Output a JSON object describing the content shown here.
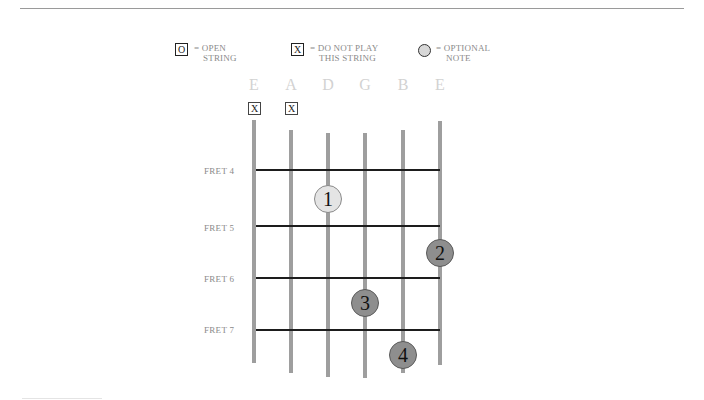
{
  "legend": {
    "open": {
      "symbol": "O",
      "line1": "= OPEN",
      "line2": "STRING"
    },
    "mute": {
      "symbol": "X",
      "line1": "= DO NOT PLAY",
      "line2": "THIS STRING"
    },
    "optional": {
      "line1": "= OPTIONAL",
      "line2": "NOTE"
    }
  },
  "strings": [
    "E",
    "A",
    "D",
    "G",
    "B",
    "E"
  ],
  "muted_strings": [
    {
      "string": "E",
      "symbol": "X"
    },
    {
      "string": "A",
      "symbol": "X"
    }
  ],
  "frets": [
    {
      "label": "FRET 4"
    },
    {
      "label": "FRET 5"
    },
    {
      "label": "FRET 6"
    },
    {
      "label": "FRET 7"
    }
  ],
  "notes": [
    {
      "finger": "1",
      "string": "D",
      "fret": 4,
      "type": "optional"
    },
    {
      "finger": "2",
      "string": "E",
      "fret": 5,
      "type": "played"
    },
    {
      "finger": "3",
      "string": "G",
      "fret": 6,
      "type": "played"
    },
    {
      "finger": "4",
      "string": "B",
      "fret": 7,
      "type": "played"
    }
  ],
  "colors": {
    "string": "#9e9e9e",
    "fret": "#1d1d1d",
    "played_dot": "#8e8e8e",
    "optional_dot": "#e4e4e4",
    "label_text": "#8a8a8a",
    "string_name": "#d2d2d2"
  }
}
